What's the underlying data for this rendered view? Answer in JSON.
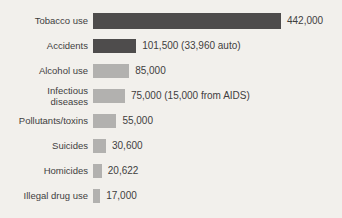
{
  "chart_data": {
    "type": "bar",
    "orientation": "horizontal",
    "title": "",
    "xlabel": "",
    "ylabel": "",
    "xlim": [
      0,
      442000
    ],
    "max_value": 442000,
    "grid": false,
    "legend": false,
    "categories": [
      "Tobacco use",
      "Accidents",
      "Alcohol use",
      "Infectious\ndiseases",
      "Pollutants/toxins",
      "Suicides",
      "Homicides",
      "Illegal drug use"
    ],
    "values": [
      442000,
      101500,
      85000,
      75000,
      55000,
      30600,
      20622,
      17000
    ],
    "value_labels": [
      "442,000",
      "101,500 (33,960 auto)",
      "85,000",
      "75,000 (15,000 from AIDS)",
      "55,000",
      "30,600",
      "20,622",
      "17,000"
    ],
    "bar_colors": [
      "#4e4c4c",
      "#4e4c4c",
      "#b2b1af",
      "#b2b1af",
      "#b2b1af",
      "#b2b1af",
      "#b2b1af",
      "#b2b1af"
    ],
    "colors": {
      "dark_bar": "#4e4c4c",
      "light_bar": "#b2b1af",
      "background": "#f2f0ec",
      "text": "#3f3e3e"
    },
    "max_bar_width_px": 188
  }
}
